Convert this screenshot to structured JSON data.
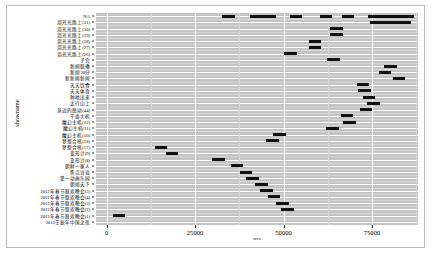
{
  "chart_data": {
    "type": "scatter",
    "title": "",
    "xlabel": "secs",
    "ylabel": "showname",
    "xlim": [
      -3000,
      88000
    ],
    "xticks": [
      0,
      25000,
      50000,
      75000
    ],
    "xticklabels": [
      "0",
      "25000",
      "50000",
      "75000"
    ],
    "grid": true,
    "legend": "none",
    "panel_bg": "#c4c4c4",
    "grid_major_color": "#ffffff",
    "grid_minor_color": "#d6d6d6",
    "point_color": "#111111",
    "categories": [
      "NA",
      "泪光光路上(31)",
      "泪光光路上(30)",
      "泪光光路上(29)",
      "泪光光路上(28)",
      "泪光光路上(27)",
      "泪光光路上(26)",
      "新闻联播",
      "新闻30分",
      "新闻夜新闻",
      "天天饮食",
      "天天体育",
      "种地出来",
      "太行山上",
      "身边的感动(44)",
      "千面大机(13)",
      "魔幻主机(12)",
      "魔幻主机(11)",
      "魔幻主机(10)",
      "梦想合唱(18)",
      "梦想合唱(17)",
      "变形计(9)",
      "变形计(8)",
      "朝鲜一家人",
      "焦点访谈",
      "第一动画乐园",
      "朝闻天下",
      "2012年春节联欢晚会(5)",
      "2012年春节联欢晚会(4)",
      "2012年春节联欢晚会(3)",
      "2012年春节联欢晚会(2)",
      "2012年春节联欢晚会(1)",
      "2012壬辰年中国之夜"
    ],
    "points": [
      {
        "row": 0,
        "x": 53500
      },
      {
        "row": 0,
        "x": 68200
      },
      {
        "row": 0,
        "x": 75600
      },
      {
        "row": 0,
        "x": 78200
      },
      {
        "row": 0,
        "x": 80900
      },
      {
        "row": 0,
        "x": 82400
      },
      {
        "row": 0,
        "x": 84300
      },
      {
        "row": 0,
        "x": 85200
      },
      {
        "row": 0,
        "x": 42300
      },
      {
        "row": 0,
        "x": 46100
      },
      {
        "row": 0,
        "x": 62000
      },
      {
        "row": 0,
        "x": 34500
      },
      {
        "row": 1,
        "x": 79200
      },
      {
        "row": 1,
        "x": 80600
      },
      {
        "row": 1,
        "x": 81900
      },
      {
        "row": 1,
        "x": 83100
      },
      {
        "row": 1,
        "x": 84200
      },
      {
        "row": 1,
        "x": 76200
      },
      {
        "row": 2,
        "x": 64900
      },
      {
        "row": 3,
        "x": 64900
      },
      {
        "row": 4,
        "x": 58900
      },
      {
        "row": 5,
        "x": 58900
      },
      {
        "row": 6,
        "x": 52000
      },
      {
        "row": 7,
        "x": 64200
      },
      {
        "row": 8,
        "x": 80200
      },
      {
        "row": 9,
        "x": 78700
      },
      {
        "row": 10,
        "x": 82600
      },
      {
        "row": 11,
        "x": 72400
      },
      {
        "row": 12,
        "x": 72800
      },
      {
        "row": 13,
        "x": 74200
      },
      {
        "row": 14,
        "x": 75400
      },
      {
        "row": 15,
        "x": 73300
      },
      {
        "row": 16,
        "x": 67900
      },
      {
        "row": 17,
        "x": 68700
      },
      {
        "row": 18,
        "x": 63800
      },
      {
        "row": 19,
        "x": 48800
      },
      {
        "row": 20,
        "x": 46900
      },
      {
        "row": 21,
        "x": 15400
      },
      {
        "row": 22,
        "x": 18500
      },
      {
        "row": 23,
        "x": 31700
      },
      {
        "row": 24,
        "x": 36900
      },
      {
        "row": 25,
        "x": 39400
      },
      {
        "row": 26,
        "x": 41300
      },
      {
        "row": 27,
        "x": 43700
      },
      {
        "row": 28,
        "x": 45100
      },
      {
        "row": 29,
        "x": 47300
      },
      {
        "row": 30,
        "x": 49700
      },
      {
        "row": 31,
        "x": 51100
      },
      {
        "row": 32,
        "x": 3500
      }
    ]
  },
  "yaxis": {
    "title": "showname",
    "labels": [
      "NA",
      "泪光光路上(31)",
      "泪光光路上(30)",
      "泪光光路上(29)",
      "泪光光路上(28)",
      "泪光光路上(27)",
      "泪光光路上(26)",
      "子宫",
      "新闻联播",
      "新闻30分",
      "新新闻新闻",
      "天天饮食",
      "天天体育",
      "种地出来",
      "太行山上",
      "身边的感动(44)",
      "千面大机",
      "魔幻主机(12)",
      "魔幻主机(11)",
      "魔幻主机(10)",
      "梦想合唱(18)",
      "梦想合唱(17)",
      "变形计(9)",
      "变形计(8)",
      "朝鲜一家人",
      "焦点访谈",
      "第一动画乐园",
      "朝闻天下",
      "2012年春节联欢晚会(5)",
      "2012年春节联欢晚会(4)",
      "2012年春节联欢晚会(3)",
      "2012年春节联欢晚会(2)",
      "2012年春节联欢晚会(1)",
      "2012壬辰年中国之夜"
    ]
  },
  "xaxis": {
    "title": "secs",
    "ticklabels": [
      "0",
      "25000",
      "50000",
      "75000"
    ]
  }
}
